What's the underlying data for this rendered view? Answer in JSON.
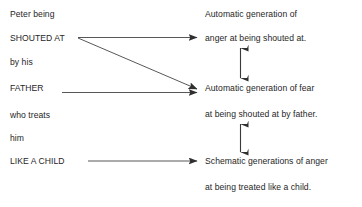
{
  "diagram": {
    "type": "flow-diagram",
    "background_color": "#ffffff",
    "text_color": "#262626",
    "line_color": "#3a3a3a",
    "stimulus": {
      "name": "Peter",
      "lines": [
        {
          "text": "Peter being",
          "emphasis": false
        },
        {
          "text": "SHOUTED AT",
          "emphasis": true
        },
        {
          "text": "by his",
          "emphasis": false
        },
        {
          "text": "FATHER",
          "emphasis": true
        },
        {
          "text": "who treats",
          "emphasis": false
        },
        {
          "text": "him",
          "emphasis": false
        },
        {
          "text": "LIKE A CHILD",
          "emphasis": true
        }
      ]
    },
    "responses": [
      {
        "id": "anger-shouted-at",
        "line1": "Automatic generation of",
        "line2": "anger at being shouted at."
      },
      {
        "id": "fear-shouted-at-by-father",
        "line1": "Automatic generation of fear",
        "line2": "at being shouted at by father."
      },
      {
        "id": "schematic-anger-treated-like-child",
        "line1": "Schematic generations of anger",
        "line2": "at being treated like a child."
      }
    ],
    "connectors": [
      {
        "id": "shouted-at-to-anger",
        "from": "SHOUTED AT",
        "to": "anger at being shouted at.",
        "style": "single-arrow",
        "direction": "horizontal"
      },
      {
        "id": "shouted-at-to-fear",
        "from": "SHOUTED AT",
        "to": "Automatic generation of fear",
        "style": "single-arrow",
        "direction": "diagonal-down"
      },
      {
        "id": "father-to-fear",
        "from": "FATHER",
        "to": "Automatic generation of fear",
        "style": "single-arrow",
        "direction": "horizontal"
      },
      {
        "id": "like-a-child-to-schematic",
        "from": "LIKE A CHILD",
        "to": "Schematic generations of anger",
        "style": "single-arrow",
        "direction": "horizontal"
      },
      {
        "id": "anger-fear-bidirectional",
        "from": "anger at being shouted at.",
        "to": "Automatic generation of fear",
        "style": "double-arrow",
        "direction": "vertical"
      },
      {
        "id": "fear-schematic-bidirectional",
        "from": "at being shouted at by father.",
        "to": "Schematic generations of anger",
        "style": "double-arrow",
        "direction": "vertical"
      }
    ],
    "caption_fragment": "a figure cut off at the bottom edge"
  }
}
